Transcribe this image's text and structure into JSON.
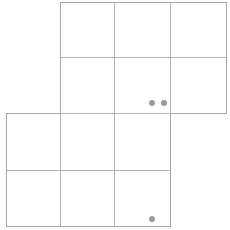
{
  "canvas": {
    "width": 230,
    "height": 230,
    "background_color": "#ffffff"
  },
  "board": {
    "name": "grid-board",
    "cell_size": 56,
    "line_color": "#a8a8a8",
    "inner_line_color": "#b4b4b4",
    "line_width": 1,
    "cell_fill": "#ffffff",
    "blocks": [
      {
        "name": "upper-block",
        "x": 60,
        "y": 2,
        "cols": 3,
        "rows": 2,
        "width": 166,
        "height": 111
      },
      {
        "name": "lower-block",
        "x": 6,
        "y": 113,
        "cols": 3,
        "rows": 2,
        "width": 164,
        "height": 113
      }
    ],
    "cells": [
      {
        "name": "cell-r0-c1",
        "x": 60,
        "y": 2,
        "w": 54,
        "h": 55
      },
      {
        "name": "cell-r0-c2",
        "x": 114,
        "y": 2,
        "w": 56,
        "h": 55
      },
      {
        "name": "cell-r0-c3",
        "x": 170,
        "y": 2,
        "w": 56,
        "h": 55
      },
      {
        "name": "cell-r1-c1",
        "x": 60,
        "y": 57,
        "w": 54,
        "h": 56
      },
      {
        "name": "cell-r1-c2",
        "x": 114,
        "y": 57,
        "w": 56,
        "h": 56
      },
      {
        "name": "cell-r1-c3",
        "x": 170,
        "y": 57,
        "w": 56,
        "h": 56
      },
      {
        "name": "cell-r2-c0",
        "x": 6,
        "y": 113,
        "w": 54,
        "h": 57
      },
      {
        "name": "cell-r2-c1",
        "x": 60,
        "y": 113,
        "w": 54,
        "h": 57
      },
      {
        "name": "cell-r2-c2",
        "x": 114,
        "y": 113,
        "w": 56,
        "h": 57
      },
      {
        "name": "cell-r3-c0",
        "x": 6,
        "y": 170,
        "w": 54,
        "h": 56
      },
      {
        "name": "cell-r3-c1",
        "x": 60,
        "y": 170,
        "w": 54,
        "h": 56
      },
      {
        "name": "cell-r3-c2",
        "x": 114,
        "y": 170,
        "w": 56,
        "h": 56
      }
    ],
    "outline_paths": [
      "M 60 2 L 226 2 L 226 113 L 170 113 L 170 226 L 6 226 L 6 113 L 60 113 Z"
    ],
    "inner_lines": [
      {
        "name": "h-line-upper-mid",
        "x1": 60,
        "y1": 57,
        "x2": 226,
        "y2": 57
      },
      {
        "name": "h-line-lower-mid",
        "x1": 6,
        "y1": 170,
        "x2": 170,
        "y2": 170
      },
      {
        "name": "h-line-block-seam",
        "x1": 60,
        "y1": 113,
        "x2": 170,
        "y2": 113
      },
      {
        "name": "v-line-upper-a",
        "x1": 114,
        "y1": 2,
        "x2": 114,
        "y2": 113
      },
      {
        "name": "v-line-upper-b",
        "x1": 170,
        "y1": 2,
        "x2": 170,
        "y2": 113
      },
      {
        "name": "v-line-lower-a",
        "x1": 60,
        "y1": 113,
        "x2": 60,
        "y2": 226
      },
      {
        "name": "v-line-lower-b",
        "x1": 114,
        "y1": 113,
        "x2": 114,
        "y2": 226
      }
    ]
  },
  "tokens": {
    "color": "#9a9a9a",
    "radius": 3,
    "count": 3,
    "items": [
      {
        "name": "token-dot-1",
        "cx": 152,
        "cy": 103,
        "r": 3,
        "color": "#9a9a9a"
      },
      {
        "name": "token-dot-2",
        "cx": 164,
        "cy": 103,
        "r": 3,
        "color": "#9a9a9a"
      },
      {
        "name": "token-dot-3",
        "cx": 152,
        "cy": 219,
        "r": 3,
        "color": "#9a9a9a"
      }
    ]
  }
}
